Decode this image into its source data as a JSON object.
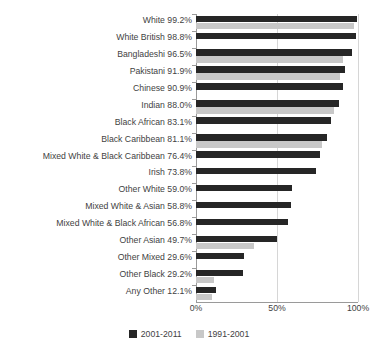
{
  "chart_data": {
    "type": "bar",
    "orientation": "horizontal",
    "title": "",
    "xlabel": "",
    "ylabel": "",
    "xlim": [
      0,
      100
    ],
    "xticks": [
      "0%",
      "50%",
      "100%"
    ],
    "xtick_values": [
      0,
      50,
      100
    ],
    "grid": true,
    "legend_position": "bottom",
    "colors": {
      "series_2001_2011": "#262626",
      "series_1991_2001": "#c8c8c8",
      "axis": "#9a9a9a",
      "gridline": "#d6d6d6",
      "text": "#3f3f3f",
      "background": "#ffffff"
    },
    "categories": [
      "White",
      "White British",
      "Bangladeshi",
      "Pakistani",
      "Chinese",
      "Indian",
      "Black African",
      "Black Caribbean",
      "Mixed White & Black Caribbean",
      "Irish",
      "Other White",
      "Mixed White & Asian",
      "Mixed White & Black African",
      "Other Asian",
      "Other Mixed",
      "Other Black",
      "Any Other"
    ],
    "category_labels": [
      "White 99.2%",
      "White British 98.8%",
      "Bangladeshi 96.5%",
      "Pakistani 91.9%",
      "Chinese 90.9%",
      "Indian 88.0%",
      "Black African 83.1%",
      "Black Caribbean 81.1%",
      "Mixed White & Black Caribbean 76.4%",
      "Irish 73.8%",
      "Other White 59.0%",
      "Mixed White & Asian 58.8%",
      "Mixed White & Black African 56.8%",
      "Other Asian 49.7%",
      "Other Mixed 29.6%",
      "Other Black 29.2%",
      "Any Other 12.1%"
    ],
    "series": [
      {
        "name": "2001-2011",
        "color": "#262626",
        "values": [
          99.2,
          98.8,
          96.5,
          91.9,
          90.9,
          88.0,
          83.1,
          81.1,
          76.4,
          73.8,
          59.0,
          58.8,
          56.8,
          49.7,
          29.6,
          29.2,
          12.1
        ]
      },
      {
        "name": "1991-2001",
        "color": "#c8c8c8",
        "values": [
          97.8,
          0,
          91.0,
          89.0,
          0,
          85.0,
          0,
          78.0,
          0,
          0,
          0,
          0,
          0,
          35.5,
          0,
          11.0,
          10.0
        ]
      }
    ]
  },
  "legend": {
    "items": [
      {
        "label": "2001-2011",
        "color": "#262626"
      },
      {
        "label": "1991-2001",
        "color": "#c8c8c8"
      }
    ]
  }
}
